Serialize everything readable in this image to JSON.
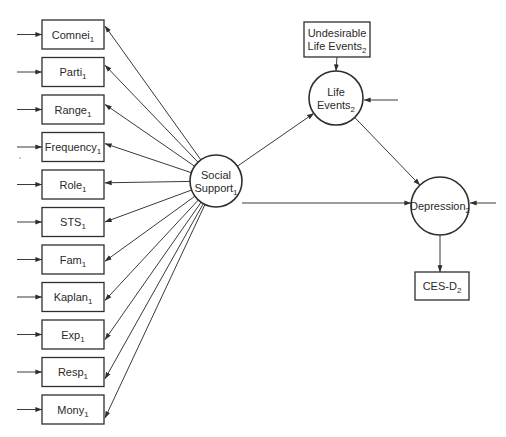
{
  "diagram": {
    "type": "path-diagram",
    "colors": {
      "line": "#2e2e2e",
      "background": "#ffffff",
      "text": "#2a2a2a"
    },
    "latent_nodes": [
      {
        "id": "social_support",
        "label_lines": [
          "Social",
          "Support"
        ],
        "subscript": "1",
        "cx": 216,
        "cy": 181,
        "r": 26
      },
      {
        "id": "life_events",
        "label_lines": [
          "Life",
          "Events"
        ],
        "subscript": "2",
        "cx": 336,
        "cy": 98,
        "r": 27
      },
      {
        "id": "depression",
        "label_lines": [
          "Depression"
        ],
        "subscript": "2",
        "cx": 440,
        "cy": 206,
        "r": 29
      }
    ],
    "indicator_boxes": [
      {
        "id": "comnei",
        "label": "Comnei",
        "subscript": "1"
      },
      {
        "id": "parti",
        "label": "Parti",
        "subscript": "1"
      },
      {
        "id": "range",
        "label": "Range",
        "subscript": "1"
      },
      {
        "id": "frequency",
        "label": "Frequency",
        "subscript": "1"
      },
      {
        "id": "role",
        "label": "Role",
        "subscript": "1"
      },
      {
        "id": "sts",
        "label": "STS",
        "subscript": "1"
      },
      {
        "id": "fam",
        "label": "Fam",
        "subscript": "1"
      },
      {
        "id": "kaplan",
        "label": "Kaplan",
        "subscript": "1"
      },
      {
        "id": "exp",
        "label": "Exp",
        "subscript": "1"
      },
      {
        "id": "resp",
        "label": "Resp",
        "subscript": "1"
      },
      {
        "id": "mony",
        "label": "Mony",
        "subscript": "1"
      }
    ],
    "other_boxes": [
      {
        "id": "undesirable_life_events",
        "label_lines": [
          "Undesirable",
          "Life Events"
        ],
        "subscript": "2",
        "x": 304,
        "y": 22,
        "w": 66,
        "h": 35
      },
      {
        "id": "ces_d",
        "label": "CES-D",
        "subscript": "2",
        "x": 415,
        "y": 272,
        "w": 54,
        "h": 28
      }
    ],
    "edges": [
      {
        "from": "social_support",
        "to": "indicators (all 11)"
      },
      {
        "from": "social_support",
        "to": "life_events"
      },
      {
        "from": "social_support",
        "to": "depression"
      },
      {
        "from": "life_events",
        "to": "depression"
      },
      {
        "from": "undesirable_life_events",
        "to": "life_events"
      },
      {
        "from": "depression",
        "to": "ces_d"
      },
      {
        "from": "error",
        "to": "each indicator box (left)"
      },
      {
        "from": "error",
        "to": "life_events (right)"
      },
      {
        "from": "error",
        "to": "depression (right)"
      }
    ]
  }
}
